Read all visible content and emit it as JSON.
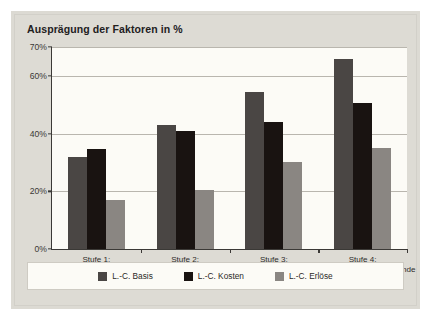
{
  "chart_data": {
    "type": "bar",
    "title": "Ausprägung der Faktoren in %",
    "xlabel": "",
    "ylabel": "",
    "ylim": [
      0,
      70
    ],
    "grid": true,
    "legend_position": "bottom",
    "ytick_labels": [
      "0%",
      "20%",
      "40%",
      "60%",
      "70%"
    ],
    "ytick_values": [
      0,
      20,
      40,
      60,
      70
    ],
    "categories": [
      "Stufe 1:\n„TUL-Logistik“",
      "Stufe 2:\n„Koordinations-\nfunktion“",
      "Stufe 3:\n„Interne Führungs-\nfunktion“",
      "Stufe 4:\n„Unternehmensübergreifende\nFührungsfunktion“"
    ],
    "category_lines": [
      [
        "Stufe 1:",
        "„TUL-Logistik“"
      ],
      [
        "Stufe 2:",
        "„Koordinations-",
        "funktion“"
      ],
      [
        "Stufe 3:",
        "„Interne Führungs-",
        "funktion“"
      ],
      [
        "Stufe 4:",
        "„Unternehmensübergreifende",
        "Führungsfunktion“"
      ]
    ],
    "series": [
      {
        "name": "L.-C. Basis",
        "color": "#4a4644",
        "values": [
          32,
          43,
          54.5,
          66
        ]
      },
      {
        "name": "L.-C. Kosten",
        "color": "#191311",
        "values": [
          34.5,
          41,
          44,
          50.5
        ]
      },
      {
        "name": "L.-C. Erlöse",
        "color": "#8a8682",
        "values": [
          17,
          20.5,
          30,
          35
        ]
      }
    ]
  },
  "legend": {
    "items": [
      {
        "label": "L.-C. Basis"
      },
      {
        "label": "L.-C. Kosten"
      },
      {
        "label": "L.-C. Erlöse"
      }
    ]
  }
}
